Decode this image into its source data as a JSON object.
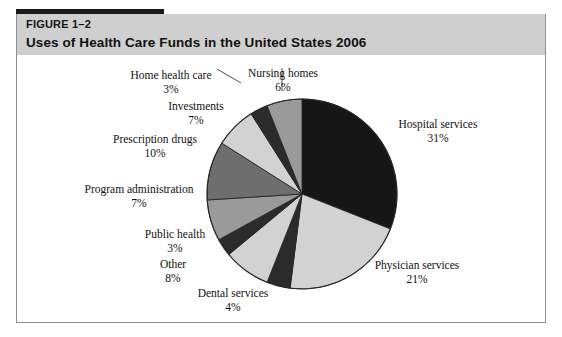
{
  "figure": {
    "number": "FIGURE 1–2",
    "title": "Uses of Health Care Funds in the United States 2006"
  },
  "colors": {
    "band": "#cfcfcf",
    "rule": "#1a1a1a",
    "border": "#8e8e8e",
    "page": "#ffffff",
    "text": "#111111",
    "slice_black": "#161616",
    "slice_light": "#d2d2d2",
    "slice_dark": "#2b2b2b",
    "slice_medium": "#9a9a9a",
    "slice_mediumdark": "#6e6e6e"
  },
  "chart_data": {
    "type": "pie",
    "title": "Uses of Health Care Funds in the United States 2006",
    "xlabel": "",
    "ylabel": "",
    "legend": "none",
    "grid": false,
    "start_angle_deg": 0,
    "direction": "clockwise",
    "units": "percent",
    "categories": [
      "Hospital services",
      "Physician services",
      "Dental services",
      "Other",
      "Public health",
      "Program administration",
      "Prescription drugs",
      "Investments",
      "Home health care",
      "Nursing homes"
    ],
    "values": [
      31,
      21,
      4,
      8,
      3,
      7,
      10,
      7,
      3,
      6
    ],
    "slices": [
      {
        "label": "Hospital services",
        "value": 31,
        "pct_text": "31%",
        "fill": "#161616",
        "label_pos": "right-upper"
      },
      {
        "label": "Physician services",
        "value": 21,
        "pct_text": "21%",
        "fill": "#d2d2d2",
        "label_pos": "right-lower"
      },
      {
        "label": "Dental services",
        "value": 4,
        "pct_text": "4%",
        "fill": "#2b2b2b",
        "label_pos": "bottom"
      },
      {
        "label": "Other",
        "value": 8,
        "pct_text": "8%",
        "fill": "#d2d2d2",
        "label_pos": "bottom-left"
      },
      {
        "label": "Public health",
        "value": 3,
        "pct_text": "3%",
        "fill": "#2b2b2b",
        "label_pos": "left-lower"
      },
      {
        "label": "Program administration",
        "value": 7,
        "pct_text": "7%",
        "fill": "#9a9a9a",
        "label_pos": "left"
      },
      {
        "label": "Prescription drugs",
        "value": 10,
        "pct_text": "10%",
        "fill": "#6e6e6e",
        "label_pos": "left-upper"
      },
      {
        "label": "Investments",
        "value": 7,
        "pct_text": "7%",
        "fill": "#d2d2d2",
        "label_pos": "top-left"
      },
      {
        "label": "Home health care",
        "value": 3,
        "pct_text": "3%",
        "fill": "#2b2b2b",
        "label_pos": "top-left-outer"
      },
      {
        "label": "Nursing homes",
        "value": 6,
        "pct_text": "6%",
        "fill": "#9a9a9a",
        "label_pos": "top"
      }
    ]
  }
}
